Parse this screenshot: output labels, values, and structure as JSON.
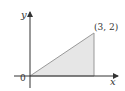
{
  "diagram": {
    "type": "region-plot",
    "axes": {
      "x_label": "x",
      "y_label": "y",
      "origin_label": "0"
    },
    "point": {
      "label": "(3, 2)",
      "x": 3,
      "y": 2
    },
    "region": {
      "shape": "triangle",
      "vertices": [
        [
          0,
          0
        ],
        [
          3,
          0
        ],
        [
          3,
          2
        ]
      ],
      "fill": "#e6e6e6",
      "stroke": "#999999"
    },
    "colors": {
      "axis": "#333333",
      "edge": "#999999"
    }
  }
}
